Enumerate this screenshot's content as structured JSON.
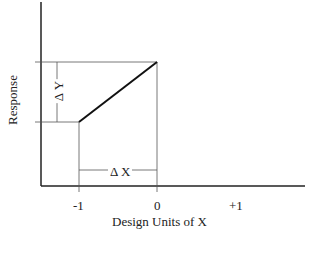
{
  "diagram": {
    "y_axis_label": "Response",
    "x_axis_label": "Design Units of X",
    "x_ticks": [
      "-1",
      "0",
      "+1"
    ],
    "delta_y_label": "Δ Y",
    "delta_x_label": "Δ X",
    "line": {
      "from": {
        "x": -1,
        "y": "low"
      },
      "to": {
        "x": 0,
        "y": "high"
      }
    },
    "colors": {
      "axis": "#222222",
      "guide": "#555555",
      "line": "#111111"
    }
  }
}
